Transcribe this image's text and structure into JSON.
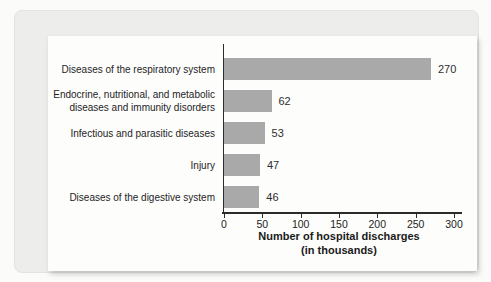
{
  "figure": {
    "background_color": "#fbfbfa",
    "card_color": "#edeeec",
    "panel_color": "#fdfdfc"
  },
  "chart_data": {
    "type": "bar",
    "orientation": "horizontal",
    "title": "",
    "categories": [
      "Diseases of the respiratory system",
      "Endocrine, nutritional, and metabolic diseases and immunity disorders",
      "Infectious and parasitic diseases",
      "Injury",
      "Diseases of the digestive system"
    ],
    "category_label_lines": [
      [
        "Diseases of the respiratory system"
      ],
      [
        "Endocrine, nutritional, and metabolic",
        "diseases and immunity disorders"
      ],
      [
        "Infectious and parasitic diseases"
      ],
      [
        "Injury"
      ],
      [
        "Diseases of the digestive system"
      ]
    ],
    "values": [
      270,
      62,
      53,
      47,
      46
    ],
    "value_labels": [
      "270",
      "62",
      "53",
      "47",
      "46"
    ],
    "xlabel_line1": "Number of hospital discharges",
    "xlabel_line2": "(in thousands)",
    "ylabel": "",
    "xlim": [
      0,
      300
    ],
    "xticks": [
      0,
      50,
      100,
      150,
      200,
      250,
      300
    ],
    "grid": false,
    "legend": false,
    "bar_color": "#a9a9a9",
    "axis_color": "#2b2b2b"
  }
}
